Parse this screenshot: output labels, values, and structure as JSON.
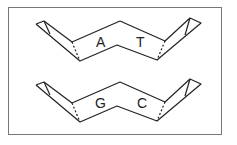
{
  "diagram": {
    "title": "",
    "frame_color": "#555555",
    "line_color": "#222222",
    "base_pairs": [
      {
        "left": "A",
        "right": "T"
      },
      {
        "left": "G",
        "right": "C"
      }
    ]
  }
}
